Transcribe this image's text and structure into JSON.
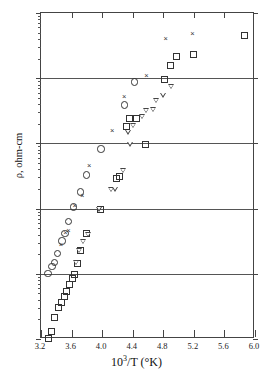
{
  "chart_data": {
    "type": "scatter",
    "title": "",
    "xlabel": "10³/T (°K)",
    "ylabel": "ρ, ohm-cm",
    "xlim": [
      3.2,
      6.0
    ],
    "ylim": [
      10000000.0,
      1000000000000.0
    ],
    "yscale": "log",
    "xscale": "linear",
    "grid": "horizontal-decades",
    "legend": "none",
    "xticks": [
      3.2,
      3.6,
      4.0,
      4.4,
      4.8,
      5.2,
      5.6,
      6.0
    ],
    "xtick_labels": [
      "3.2",
      "3.6",
      "4.0",
      "4.4",
      "4.8",
      "5.2",
      "5.6",
      "6.0"
    ],
    "yticks": [
      10000000.0,
      100000000.0,
      1000000000.0,
      10000000000.0,
      100000000000.0,
      1000000000000.0
    ],
    "ytick_labels": [
      "10⁷",
      "10⁸",
      "10⁹",
      "10¹⁰",
      "10¹¹",
      "10¹²"
    ],
    "ytick_mantissas": [
      "10",
      "10",
      "10",
      "10",
      "10",
      "10"
    ],
    "ytick_exponents": [
      "7",
      "8",
      "9",
      "10",
      "11",
      "12"
    ],
    "series": [
      {
        "name": "circle-series",
        "marker": "circle",
        "points": [
          [
            3.28,
            105000000.0
          ],
          [
            3.33,
            135000000.0
          ],
          [
            3.36,
            155000000.0
          ],
          [
            3.4,
            210000000.0
          ],
          [
            3.46,
            330000000.0
          ],
          [
            3.5,
            430000000.0
          ],
          [
            3.55,
            660000000.0
          ],
          [
            3.61,
            1100000000.0
          ],
          [
            3.7,
            1850000000.0
          ],
          [
            3.78,
            3400000000.0
          ],
          [
            3.97,
            8500000000.0
          ],
          [
            4.28,
            40000000000.0
          ],
          [
            4.41,
            90000000000.0
          ]
        ]
      },
      {
        "name": "x-series",
        "marker": "x",
        "points": [
          [
            3.46,
            280000000.0
          ],
          [
            3.52,
            430000000.0
          ],
          [
            3.56,
            460000000.0
          ],
          [
            3.64,
            1100000000.0
          ],
          [
            3.74,
            1600000000.0
          ],
          [
            3.83,
            4600000000.0
          ],
          [
            4.13,
            16000000000.0
          ],
          [
            4.29,
            53000000000.0
          ],
          [
            4.58,
            110000000000.0
          ],
          [
            4.83,
            400000000000.0
          ],
          [
            5.18,
            490000000000.0
          ]
        ]
      },
      {
        "name": "square-series",
        "marker": "square",
        "points": [
          [
            3.28,
            10500000.0
          ],
          [
            3.32,
            13500000.0
          ],
          [
            3.37,
            22000000.0
          ],
          [
            3.41,
            31000000.0
          ],
          [
            3.45,
            38000000.0
          ],
          [
            3.49,
            46000000.0
          ],
          [
            3.52,
            55000000.0
          ],
          [
            3.56,
            70000000.0
          ],
          [
            3.6,
            88000000.0
          ],
          [
            3.62,
            100000000.0
          ],
          [
            3.66,
            150000000.0
          ],
          [
            3.71,
            240000000.0
          ],
          [
            3.78,
            430000000.0
          ],
          [
            3.97,
            1000000000.0
          ],
          [
            4.18,
            3000000000.0
          ],
          [
            4.22,
            3200000000.0
          ],
          [
            4.3,
            19000000000.0
          ],
          [
            4.34,
            25000000000.0
          ],
          [
            4.43,
            25000000000.0
          ],
          [
            4.55,
            9900000000.0
          ],
          [
            4.8,
            98000000000.0
          ],
          [
            4.88,
            160000000000.0
          ],
          [
            4.96,
            220000000000.0
          ],
          [
            5.18,
            240000000000.0
          ],
          [
            5.85,
            470000000000.0
          ]
        ]
      },
      {
        "name": "triangle-series",
        "marker": "triangle-down",
        "points": [
          [
            3.66,
            150000000.0
          ],
          [
            3.7,
            230000000.0
          ],
          [
            3.75,
            310000000.0
          ],
          [
            3.81,
            400000000.0
          ],
          [
            3.96,
            980000000.0
          ],
          [
            4.12,
            1950000000.0
          ],
          [
            4.17,
            2000000000.0
          ],
          [
            4.27,
            3800000000.0
          ],
          [
            4.37,
            9800000000.0
          ],
          [
            4.34,
            15000000000.0
          ],
          [
            4.41,
            19000000000.0
          ],
          [
            4.52,
            26000000000.0
          ],
          [
            4.58,
            32000000000.0
          ],
          [
            4.66,
            33000000000.0
          ],
          [
            4.7,
            45000000000.0
          ],
          [
            4.8,
            55000000000.0
          ],
          [
            4.9,
            75000000000.0
          ]
        ]
      }
    ]
  },
  "axes": {
    "x_title": "10³/T (°K)",
    "x_title_base": "10",
    "x_title_exp": "3",
    "x_title_rest": "/T (°K)",
    "y_title": "ρ, ohm-cm"
  },
  "colors": {
    "background": "#ffffff",
    "axis": "#444444",
    "grid": "#555555",
    "marker": "#333333"
  }
}
